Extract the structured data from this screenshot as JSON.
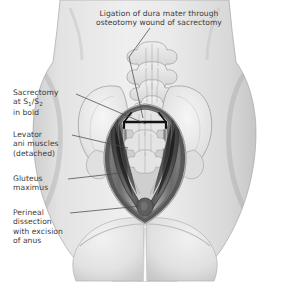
{
  "figure": {
    "orientation": "posterior (from behind)",
    "style": "grayscale medical line illustration with airbrush shading"
  },
  "labels": [
    {
      "id": "ligation",
      "text": "Ligation of dura mater through\nosteotomy wound of sacrectomy",
      "position": "top-center",
      "lines": 2,
      "leader_to": "midline sacral osteotomy / dural stump"
    },
    {
      "id": "sacrectomy",
      "text_line1": "Sacrectomy",
      "text_line2_prefix": "at S",
      "text_line2_sub1": "1",
      "text_line2_mid": "/S",
      "text_line2_sub2": "2",
      "text_line3": "in bold",
      "position": "left-upper",
      "leader_to": "bold black transverse osteotomy line across upper sacrum"
    },
    {
      "id": "levator",
      "text": "Levator\nani muscles\n(detached)",
      "position": "left-middle",
      "lines": 3,
      "leader_to": "dark muscle flap on left wall of wound"
    },
    {
      "id": "gluteus",
      "text": "Gluteus\nmaximus",
      "position": "left-lower",
      "lines": 2,
      "leader_to": "outer dark band lining the wound cavity"
    },
    {
      "id": "perineal",
      "text": "Perineal\ndissection\nwith excision\nof anus",
      "position": "left-bottom",
      "lines": 4,
      "leader_to": "small dark oval at inferior apex of wound"
    }
  ],
  "anatomy": {
    "structures": [
      "lumbar and sacral vertebrae",
      "left iliac wing",
      "right iliac wing",
      "open midline surgical wound",
      "levator ani muscle flaps",
      "gluteus maximus",
      "buttocks",
      "gluteal cleft",
      "excised anus site"
    ],
    "bold_line": {
      "name": "S1/S2 osteotomy",
      "description": "heavy black transverse line with short descending ends"
    }
  },
  "colors": {
    "background": "#ffffff",
    "skin_light": "#e9e9e9",
    "skin_mid": "#d6d6d6",
    "skin_shadow": "#bdbdbd",
    "bone_light": "#eeeeee",
    "bone_outline": "#9a9a9a",
    "muscle_dark": "#595959",
    "muscle_darker": "#3f3f3f",
    "wound_deep": "#7d7d7d",
    "bold_stroke": "#111111",
    "leader_line": "#4a4a4a",
    "text": "#3b3b3b"
  }
}
